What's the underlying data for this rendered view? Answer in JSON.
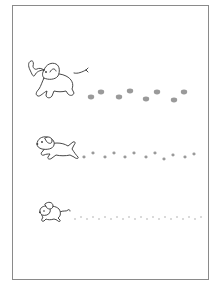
{
  "worksheet": {
    "type": "tracing-worksheet",
    "border_color": "#8a8a8a",
    "footprint_color": "#9a9a9a",
    "rows": [
      {
        "animal": "elephant",
        "icon": "elephant-icon",
        "footprint_size": "large",
        "footprints": [
          [
            91,
            97
          ],
          [
            101,
            92
          ],
          [
            119,
            97
          ],
          [
            130,
            91
          ],
          [
            146,
            99
          ],
          [
            157,
            92
          ],
          [
            174,
            100
          ],
          [
            184,
            92
          ]
        ]
      },
      {
        "animal": "dog",
        "icon": "dog-icon",
        "footprint_size": "medium",
        "footprints": [
          [
            84,
            157
          ],
          [
            93,
            153
          ],
          [
            105,
            157
          ],
          [
            114,
            153
          ],
          [
            125,
            157
          ],
          [
            134,
            153
          ],
          [
            146,
            157
          ],
          [
            155,
            153
          ],
          [
            164,
            159
          ],
          [
            173,
            155
          ],
          [
            185,
            157
          ],
          [
            194,
            154
          ]
        ]
      },
      {
        "animal": "mouse",
        "icon": "mouse-icon",
        "footprint_size": "small",
        "footprints": [
          [
            75,
            219
          ],
          [
            81,
            217
          ],
          [
            87,
            219
          ],
          [
            93,
            217
          ],
          [
            99,
            219
          ],
          [
            105,
            217
          ],
          [
            111,
            219
          ],
          [
            117,
            217
          ],
          [
            123,
            219
          ],
          [
            129,
            217
          ],
          [
            135,
            219
          ],
          [
            141,
            217
          ],
          [
            147,
            219
          ],
          [
            153,
            217
          ],
          [
            159,
            219
          ],
          [
            165,
            217
          ],
          [
            171,
            219
          ],
          [
            177,
            217
          ],
          [
            183,
            219
          ],
          [
            189,
            217
          ],
          [
            195,
            219
          ],
          [
            201,
            217
          ]
        ]
      }
    ]
  }
}
